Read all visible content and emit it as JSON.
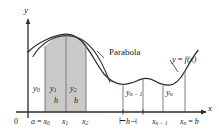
{
  "figure": {
    "axes": {
      "y_axis_label": "y",
      "x_axis_label": "x",
      "origin_label": "0"
    },
    "curve_labels": {
      "parabola": "Parabola",
      "function": "y = f(x)",
      "function_y": "y",
      "function_eq": "=",
      "function_f": "f",
      "function_arg": "(x)"
    },
    "x_ticks": [
      {
        "id": "x0",
        "text_prefix": "a",
        "text_eq": "=",
        "base": "x",
        "sub": "0",
        "combined": "a = x0"
      },
      {
        "id": "x1",
        "text_prefix": "",
        "text_eq": "",
        "base": "x",
        "sub": "1",
        "combined": "x1"
      },
      {
        "id": "x2",
        "text_prefix": "",
        "text_eq": "",
        "base": "x",
        "sub": "2",
        "combined": "x2"
      },
      {
        "id": "xn1",
        "text_prefix": "",
        "text_eq": "",
        "base": "x",
        "sub": "n − 1",
        "combined": "xn-1"
      },
      {
        "id": "xn",
        "text_prefix": "",
        "text_eq": "",
        "base": "x",
        "sub": "n",
        "combined": "xn = b",
        "text_suffix_eq": "=",
        "text_suffix": "b"
      }
    ],
    "ordinates": [
      {
        "id": "y0",
        "base": "y",
        "sub": "0"
      },
      {
        "id": "y1",
        "base": "y",
        "sub": "1"
      },
      {
        "id": "y2",
        "base": "y",
        "sub": "2"
      },
      {
        "id": "yn1",
        "base": "y",
        "sub": "n − 1"
      },
      {
        "id": "yn",
        "base": "y",
        "sub": "n"
      }
    ],
    "width_labels": {
      "h_first": "h",
      "h_second": "h",
      "h_bracket": "h",
      "bracket_left": "⊢",
      "bracket_right": "⊣"
    },
    "colors": {
      "shade_fill": "#c9c9c9",
      "shade_edge": "#7a7a7a",
      "curve": "#2b2b2b",
      "parabola": "#3a3a3a",
      "axis": "#2b2b2b",
      "gridline": "#8a8a8a",
      "text": "#1a1a1a",
      "background": "#ffffff"
    }
  }
}
